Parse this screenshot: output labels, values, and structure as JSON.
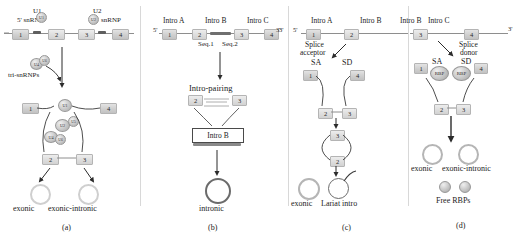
{
  "figure": {
    "caption_a": "(a)",
    "caption_b": "(b)",
    "caption_c": "(c)",
    "caption_d": "(d)"
  },
  "panel_a": {
    "label_u1": "U1",
    "label_u1_snrnp": "5' snRNP",
    "label_u2": "U2",
    "label_u2_snrnp": "snRNP",
    "label_tri": "tri-snRNPs",
    "blob_u1": "U1",
    "blob_u2": "U2",
    "blob_u4": "U4",
    "blob_u5": "U5",
    "blob_u6": "U6",
    "blob_u6b": "U6",
    "complex_u1": "U1",
    "complex_u2": "U2",
    "complex_u4": "U4",
    "complex_u5": "U5",
    "complex_u6": "U6",
    "exons": [
      "1",
      "2",
      "3",
      "4"
    ],
    "complex_exons": [
      "1",
      "4",
      "2",
      "3"
    ],
    "product_exonic": "exonic",
    "product_exonic_intronic": "exonic-intronic",
    "five_prime": "5'"
  },
  "panel_b": {
    "five_prime": "5'",
    "three_prime": "3'",
    "intro_a": "Intro A",
    "intro_b": "Intro B",
    "intro_c": "Intro C",
    "seq1": "Seq.1",
    "seq2": "Seq.2",
    "step_pairing": "Intro-pairing",
    "step_intro_b": "Intro B",
    "exons": [
      "1",
      "2",
      "3",
      "4"
    ],
    "pair_exons": [
      "2",
      "3"
    ],
    "product_intronic": "intronic"
  },
  "panel_c": {
    "five_prime": "5'",
    "three_prime": "3'",
    "intro_a": "Intro A",
    "intro_b": "Intro B",
    "intro_c": "Intro C",
    "splice_acceptor": "Splice\nacceptor",
    "splice_acceptor_l1": "Splice",
    "splice_acceptor_l2": "acceptor",
    "sa": "SA",
    "sd": "SD",
    "exons": [
      "1",
      "2",
      "3",
      "4"
    ],
    "loop_exons": [
      "1",
      "4",
      "2",
      "3"
    ],
    "circ_exons": [
      "3",
      "2"
    ],
    "product_exonic": "exonic",
    "product_lariat": "Lariat intro"
  },
  "panel_d": {
    "three_prime": "3'",
    "intro_b": "Intro B",
    "intro_c": "Intro C",
    "splice_donor_l1": "Splice",
    "splice_donor_l2": "donor",
    "sa": "SA",
    "sd": "SD",
    "rbp_left": "RBP",
    "rbp_right": "RBP",
    "exons": [
      "3",
      "4"
    ],
    "loop_exons": [
      "1",
      "4",
      "2",
      "3"
    ],
    "product_exonic": "exonic",
    "product_exonic_intronic": "exonic-intronic",
    "free_rbps": "Free RBPs"
  },
  "colors": {
    "exon_fill": "#cfcfcf",
    "intron_line": "#8e8e8e",
    "arrow": "#333333",
    "circ_light": "#cfcfcf",
    "circ_dark": "#6b6b6b"
  }
}
